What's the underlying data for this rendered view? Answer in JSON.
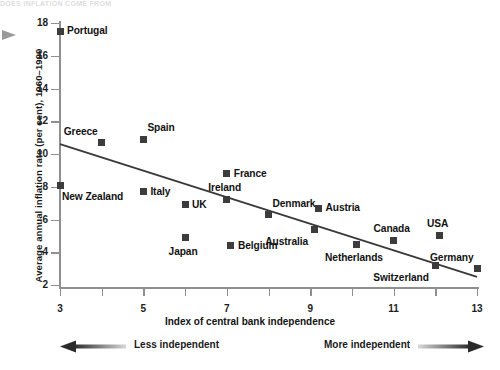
{
  "header": {
    "faint_top_text": "DOES INFLATION COME FROM"
  },
  "axes": {
    "ylabel": "Average annual inflation rate (per cent), 1960–1990",
    "xlabel": "Index of central bank independence",
    "y_ticks": [
      "2",
      "4",
      "6",
      "8",
      "10",
      "12",
      "14",
      "16",
      "18"
    ],
    "x_ticks": [
      "3",
      "5",
      "7",
      "9",
      "11",
      "13"
    ]
  },
  "direction_bar": {
    "left_label": "Less independent",
    "right_label": "More independent",
    "left_arrow_icon": "arrow-left-icon",
    "right_arrow_icon": "arrow-right-icon"
  },
  "side_marker": {
    "icon": "triangle-right-icon"
  },
  "chart_data": {
    "type": "scatter",
    "title": "",
    "xlabel": "Index of central bank independence",
    "ylabel": "Average annual inflation rate (per cent), 1960–1990",
    "xlim": [
      3,
      13
    ],
    "ylim": [
      1.2,
      18
    ],
    "grid": false,
    "legend": null,
    "marker_color": "#3c3c3c",
    "trend_line": {
      "label": "fitted regression line",
      "x": [
        3,
        13
      ],
      "y": [
        10.6,
        2.5
      ],
      "color": "#3a3a3a"
    },
    "points": [
      {
        "label": "Portugal",
        "x": 3.0,
        "y": 17.5,
        "label_pos": "right"
      },
      {
        "label": "New Zealand",
        "x": 3.0,
        "y": 8.1,
        "label_pos": "below-right"
      },
      {
        "label": "Greece",
        "x": 4.0,
        "y": 10.7,
        "label_pos": "above-left"
      },
      {
        "label": "Spain",
        "x": 5.0,
        "y": 10.9,
        "label_pos": "above-right"
      },
      {
        "label": "Italy",
        "x": 5.0,
        "y": 7.7,
        "label_pos": "right"
      },
      {
        "label": "UK",
        "x": 6.0,
        "y": 6.9,
        "label_pos": "right"
      },
      {
        "label": "Japan",
        "x": 6.0,
        "y": 4.9,
        "label_pos": "below"
      },
      {
        "label": "France",
        "x": 7.0,
        "y": 8.8,
        "label_pos": "right"
      },
      {
        "label": "Ireland",
        "x": 7.0,
        "y": 7.2,
        "label_pos": "above"
      },
      {
        "label": "Belgium",
        "x": 7.1,
        "y": 4.4,
        "label_pos": "right"
      },
      {
        "label": "Denmark",
        "x": 8.0,
        "y": 6.3,
        "label_pos": "above-right"
      },
      {
        "label": "Australia",
        "x": 9.1,
        "y": 5.4,
        "label_pos": "below-left"
      },
      {
        "label": "Austria",
        "x": 9.2,
        "y": 6.7,
        "label_pos": "right"
      },
      {
        "label": "Netherlands",
        "x": 10.1,
        "y": 4.5,
        "label_pos": "below"
      },
      {
        "label": "Canada",
        "x": 11.0,
        "y": 4.7,
        "label_pos": "above"
      },
      {
        "label": "Switzerland",
        "x": 12.0,
        "y": 3.2,
        "label_pos": "below-left"
      },
      {
        "label": "USA",
        "x": 12.1,
        "y": 5.0,
        "label_pos": "above"
      },
      {
        "label": "Germany",
        "x": 13.0,
        "y": 3.0,
        "label_pos": "above-left"
      }
    ]
  }
}
